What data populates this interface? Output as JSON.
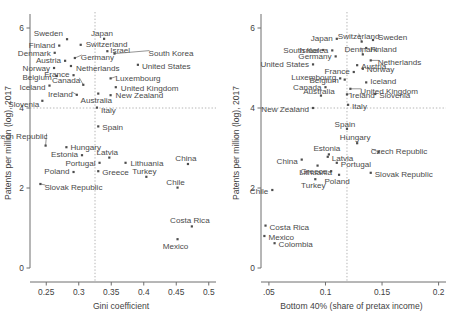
{
  "figure": {
    "title": "",
    "panels": 2
  },
  "chart_data": [
    {
      "type": "scatter",
      "panel": "left",
      "title": "",
      "xlabel": "Gini coefficient",
      "ylabel": "Patents per million (log), 2017",
      "xlim": [
        0.225,
        0.505
      ],
      "ylim": [
        0,
        6.25
      ],
      "xticks": [
        0.25,
        0.3,
        0.35,
        0.4,
        0.45,
        0.5
      ],
      "xticklabels": [
        "0.25",
        "0.3",
        "0.35",
        "0.4",
        "0.45",
        "0.5"
      ],
      "yticks": [
        0,
        2,
        4,
        6
      ],
      "yticklabels": [
        "0",
        "2",
        "4",
        "6"
      ],
      "grid": false,
      "reference_lines": {
        "x": 0.325,
        "y": 4.0
      },
      "points": [
        {
          "label": "Sweden",
          "x": 0.282,
          "y": 5.72
        },
        {
          "label": "Japan",
          "x": 0.339,
          "y": 5.73
        },
        {
          "label": "Switzerland",
          "x": 0.303,
          "y": 5.58
        },
        {
          "label": "Finland",
          "x": 0.27,
          "y": 5.56
        },
        {
          "label": "Israel",
          "x": 0.344,
          "y": 5.42
        },
        {
          "label": "South Korea",
          "x": 0.355,
          "y": 5.36
        },
        {
          "label": "Denmark",
          "x": 0.263,
          "y": 5.38
        },
        {
          "label": "Germany",
          "x": 0.294,
          "y": 5.25
        },
        {
          "label": "Austria",
          "x": 0.279,
          "y": 5.18
        },
        {
          "label": "United States",
          "x": 0.391,
          "y": 5.08
        },
        {
          "label": "Netherlands",
          "x": 0.288,
          "y": 5.05
        },
        {
          "label": "Norway",
          "x": 0.262,
          "y": 5.0
        },
        {
          "label": "France",
          "x": 0.292,
          "y": 4.82
        },
        {
          "label": "Belgium",
          "x": 0.266,
          "y": 4.8
        },
        {
          "label": "Luxembourg",
          "x": 0.349,
          "y": 4.74
        },
        {
          "label": "Canada",
          "x": 0.307,
          "y": 4.58
        },
        {
          "label": "Iceland",
          "x": 0.255,
          "y": 4.56
        },
        {
          "label": "United Kingdom",
          "x": 0.357,
          "y": 4.52
        },
        {
          "label": "Ireland",
          "x": 0.297,
          "y": 4.33
        },
        {
          "label": "Australia",
          "x": 0.33,
          "y": 4.36
        },
        {
          "label": "New Zealand",
          "x": 0.349,
          "y": 4.32
        },
        {
          "label": "Slovenia",
          "x": 0.244,
          "y": 4.18
        },
        {
          "label": "Italy",
          "x": 0.328,
          "y": 4.01
        },
        {
          "label": "Spain",
          "x": 0.33,
          "y": 3.54
        },
        {
          "label": "Czech Republic",
          "x": 0.249,
          "y": 3.06
        },
        {
          "label": "Hungary",
          "x": 0.281,
          "y": 3.02
        },
        {
          "label": "Estonia",
          "x": 0.305,
          "y": 2.82
        },
        {
          "label": "Latvia",
          "x": 0.347,
          "y": 2.76
        },
        {
          "label": "Portugal",
          "x": 0.332,
          "y": 2.63
        },
        {
          "label": "Lithuania",
          "x": 0.372,
          "y": 2.63
        },
        {
          "label": "Poland",
          "x": 0.292,
          "y": 2.4
        },
        {
          "label": "Greece",
          "x": 0.33,
          "y": 2.42
        },
        {
          "label": "Turkey",
          "x": 0.404,
          "y": 2.28
        },
        {
          "label": "China",
          "x": 0.468,
          "y": 2.6
        },
        {
          "label": "Chile",
          "x": 0.452,
          "y": 2.01
        },
        {
          "label": "Slovak Republic",
          "x": 0.241,
          "y": 2.1
        },
        {
          "label": "Costa Rica",
          "x": 0.474,
          "y": 1.04
        },
        {
          "label": "Mexico",
          "x": 0.452,
          "y": 0.72
        }
      ]
    },
    {
      "type": "scatter",
      "panel": "right",
      "title": "",
      "xlabel": "Bottom 40% (share of pretax income)",
      "ylabel": "Patents per million (log), 2017",
      "xlim": [
        0.043,
        0.203
      ],
      "ylim": [
        0,
        6.25
      ],
      "xticks": [
        0.05,
        0.1,
        0.15,
        0.2
      ],
      "xticklabels": [
        ".05",
        "0.1",
        "0.15",
        "0.2"
      ],
      "yticks": [
        0,
        2,
        4,
        6
      ],
      "yticklabels": [
        "0",
        "2",
        "4",
        "6"
      ],
      "grid": false,
      "reference_lines": {
        "x": 0.119,
        "y": 4.0
      },
      "points": [
        {
          "label": "Japan",
          "x": 0.11,
          "y": 5.73
        },
        {
          "label": "Switzerland",
          "x": 0.132,
          "y": 5.66
        },
        {
          "label": "Sweden",
          "x": 0.142,
          "y": 5.7
        },
        {
          "label": "Finland",
          "x": 0.136,
          "y": 5.5
        },
        {
          "label": "South Korea",
          "x": 0.106,
          "y": 5.44
        },
        {
          "label": "Israel",
          "x": 0.098,
          "y": 5.45
        },
        {
          "label": "Denmark",
          "x": 0.133,
          "y": 5.34
        },
        {
          "label": "Germany",
          "x": 0.109,
          "y": 5.29
        },
        {
          "label": "Netherlands",
          "x": 0.14,
          "y": 5.19
        },
        {
          "label": "Austria",
          "x": 0.128,
          "y": 5.07
        },
        {
          "label": "United States",
          "x": 0.089,
          "y": 5.09
        },
        {
          "label": "Norway",
          "x": 0.133,
          "y": 4.98
        },
        {
          "label": "France",
          "x": 0.125,
          "y": 4.9
        },
        {
          "label": "Luxembourg",
          "x": 0.113,
          "y": 4.74
        },
        {
          "label": "Belgium",
          "x": 0.117,
          "y": 4.71
        },
        {
          "label": "Iceland",
          "x": 0.136,
          "y": 4.64
        },
        {
          "label": "Canada",
          "x": 0.1,
          "y": 4.52
        },
        {
          "label": "United Kingdom",
          "x": 0.122,
          "y": 4.48
        },
        {
          "label": "Ireland",
          "x": 0.119,
          "y": 4.34
        },
        {
          "label": "Slovenia",
          "x": 0.144,
          "y": 4.35
        },
        {
          "label": "Australia",
          "x": 0.096,
          "y": 4.31
        },
        {
          "label": "Italy",
          "x": 0.12,
          "y": 4.08
        },
        {
          "label": "New Zealand",
          "x": 0.089,
          "y": 4.0
        },
        {
          "label": "Spain",
          "x": 0.119,
          "y": 3.48
        },
        {
          "label": "Hungary",
          "x": 0.128,
          "y": 3.12
        },
        {
          "label": "Czech Republic",
          "x": 0.147,
          "y": 2.9
        },
        {
          "label": "Estonia",
          "x": 0.103,
          "y": 2.84
        },
        {
          "label": "Latvia",
          "x": 0.102,
          "y": 2.78
        },
        {
          "label": "China",
          "x": 0.079,
          "y": 2.71
        },
        {
          "label": "Portugal",
          "x": 0.11,
          "y": 2.63
        },
        {
          "label": "Lithuania",
          "x": 0.093,
          "y": 2.56
        },
        {
          "label": "Greece",
          "x": 0.105,
          "y": 2.42
        },
        {
          "label": "Slovak Republic",
          "x": 0.14,
          "y": 2.38
        },
        {
          "label": "Poland",
          "x": 0.112,
          "y": 2.33
        },
        {
          "label": "Turkey",
          "x": 0.091,
          "y": 2.22
        },
        {
          "label": "Chile",
          "x": 0.053,
          "y": 1.95
        },
        {
          "label": "Costa Rica",
          "x": 0.047,
          "y": 1.06
        },
        {
          "label": "Mexico",
          "x": 0.046,
          "y": 0.8
        },
        {
          "label": "Colombia",
          "x": 0.055,
          "y": 0.62
        }
      ]
    }
  ]
}
